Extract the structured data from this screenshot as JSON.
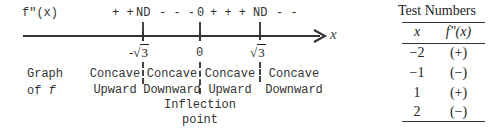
{
  "diagram": {
    "sign_row": {
      "label": "f\"(x)",
      "segments": [
        "+ +",
        "ND",
        "- - -",
        "0",
        "+ + +",
        "ND",
        "- -"
      ]
    },
    "axis": {
      "variable": "x",
      "critical_points": [
        "-√3",
        "0",
        "√3"
      ],
      "critical_point_parts": [
        {
          "sign": "-",
          "radicand": "3"
        },
        {
          "sign": "",
          "value": "0"
        },
        {
          "sign": "",
          "radicand": "3"
        }
      ]
    },
    "graph_row": {
      "label_line1": "Graph",
      "label_line2": "of f",
      "label_line2_prefix": "of ",
      "label_line2_var": "f",
      "intervals": [
        {
          "line1": "Concave",
          "line2": "Upward"
        },
        {
          "line1": "Concave",
          "line2": "Downward"
        },
        {
          "line1": "Concave",
          "line2": "Upward"
        },
        {
          "line1": "Concave",
          "line2": "Downward"
        }
      ],
      "annotation_line1": "Inflection",
      "annotation_line2": "point"
    }
  },
  "test_table": {
    "title": "Test Numbers",
    "headers": [
      "x",
      "f\"(x)"
    ],
    "rows": [
      {
        "x": "−2",
        "sign": "(+)"
      },
      {
        "x": "−1",
        "sign": "(−)"
      },
      {
        "x": "1",
        "sign": "(+)"
      },
      {
        "x": "2",
        "sign": "(−)"
      }
    ]
  }
}
